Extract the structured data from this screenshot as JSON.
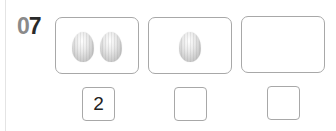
{
  "question": {
    "number_digits": [
      "0",
      "7"
    ]
  },
  "groups": [
    {
      "egg_count": 2,
      "answer": "2"
    },
    {
      "egg_count": 1,
      "answer": ""
    },
    {
      "egg_count": 0,
      "answer": ""
    }
  ],
  "colors": {
    "border": "#a8a8a8",
    "number_light": "#8a8a8a",
    "number_dark": "#2a2a2a",
    "egg_base": "#c4c4c4"
  }
}
